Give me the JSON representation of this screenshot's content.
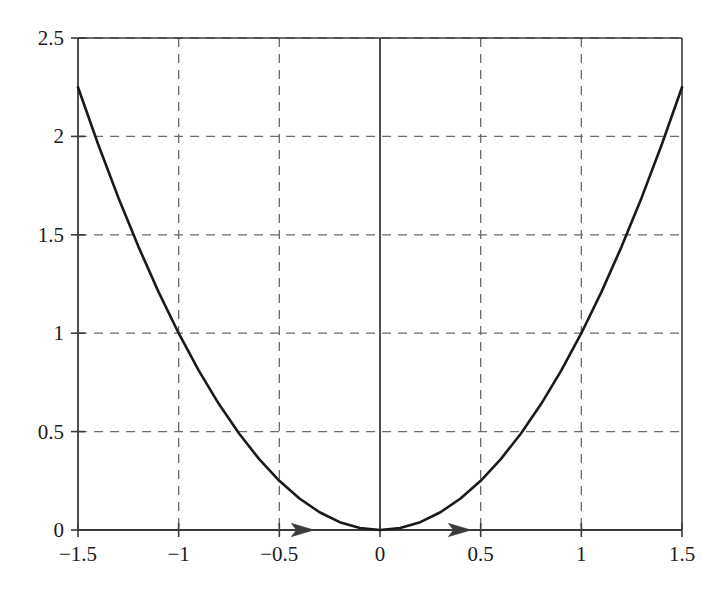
{
  "chart_data": {
    "type": "line",
    "title": "",
    "subtitle": "",
    "xlabel": "",
    "ylabel": "",
    "function": "y = x^2",
    "xlim": [
      -1.5,
      1.5
    ],
    "ylim": [
      0,
      2.5
    ],
    "grid": true,
    "grid_style": "dashed",
    "legend": "none",
    "xticks": [
      -1.5,
      -1,
      -0.5,
      0,
      0.5,
      1,
      1.5
    ],
    "xtick_labels": [
      "−1.5",
      "−1",
      "−0.5",
      "0",
      "0.5",
      "1",
      "1.5"
    ],
    "yticks": [
      0,
      0.5,
      1,
      1.5,
      2,
      2.5
    ],
    "ytick_labels": [
      "0",
      "0.5",
      "1",
      "1.5",
      "2",
      "2.5"
    ],
    "series": [
      {
        "name": "parabola",
        "color": "#1a1a1a",
        "x": [
          -1.5,
          -1.4,
          -1.3,
          -1.2,
          -1.1,
          -1.0,
          -0.9,
          -0.8,
          -0.7,
          -0.6,
          -0.5,
          -0.4,
          -0.3,
          -0.2,
          -0.1,
          0.0,
          0.1,
          0.2,
          0.3,
          0.4,
          0.5,
          0.6,
          0.7,
          0.8,
          0.9,
          1.0,
          1.1,
          1.2,
          1.3,
          1.4,
          1.5
        ],
        "y": [
          2.25,
          1.96,
          1.69,
          1.44,
          1.21,
          1.0,
          0.81,
          0.64,
          0.49,
          0.36,
          0.25,
          0.16,
          0.09,
          0.04,
          0.01,
          0.0,
          0.01,
          0.04,
          0.09,
          0.16,
          0.25,
          0.36,
          0.49,
          0.64,
          0.81,
          1.0,
          1.21,
          1.44,
          1.69,
          1.96,
          2.25
        ]
      }
    ],
    "annotations": [
      {
        "type": "arrowhead",
        "axis": "x",
        "x": -0.33,
        "y": 0,
        "direction": "right"
      },
      {
        "type": "arrowhead",
        "axis": "x",
        "x": 0.45,
        "y": 0,
        "direction": "right"
      },
      {
        "type": "vertical-line",
        "x": 0,
        "y_from": 0,
        "y_to": 2.5,
        "style": "solid"
      }
    ],
    "colors": {
      "curve": "#1a1a1a",
      "axis": "#3a3a3a",
      "grid": "#6b6b6b",
      "background": "#ffffff",
      "text": "#1a1a1a"
    }
  },
  "figure": {
    "plot_area": {
      "left": 78,
      "top": 38,
      "right": 682,
      "bottom": 530
    }
  }
}
